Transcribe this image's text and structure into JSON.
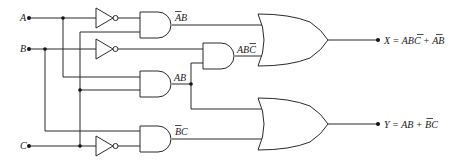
{
  "diagram": {
    "inputs": [
      {
        "name": "A",
        "label": "A"
      },
      {
        "name": "B",
        "label": "B"
      },
      {
        "name": "C",
        "label": "C"
      }
    ],
    "gates": [
      {
        "id": "not-a",
        "type": "NOT",
        "input": "A"
      },
      {
        "id": "not-b",
        "type": "NOT",
        "input": "B"
      },
      {
        "id": "not-c",
        "type": "NOT",
        "input": "C"
      },
      {
        "id": "and-abar-b",
        "type": "AND",
        "output_label": "ĀB"
      },
      {
        "id": "and-abcbar",
        "type": "AND",
        "output_label": "ABC̄"
      },
      {
        "id": "and-ab",
        "type": "AND",
        "output_label": "AB"
      },
      {
        "id": "and-bbar-c",
        "type": "AND",
        "output_label": "B̄C"
      },
      {
        "id": "or-x",
        "type": "OR"
      },
      {
        "id": "or-y",
        "type": "OR"
      }
    ],
    "labels": {
      "abar_b": {
        "bar": "A",
        "rest": "B"
      },
      "ab_cbar": {
        "pre": "AB",
        "bar": "C"
      },
      "ab": "AB",
      "bbar_c": {
        "bar": "B",
        "rest": "C"
      }
    },
    "outputs": {
      "x": {
        "lhs": "X = AB",
        "bar1": "C",
        "mid": " + ",
        "bar2": "A",
        "tail": "B",
        "text": "X = ABC̄ + ĀB"
      },
      "y": {
        "lhs": "Y = AB + ",
        "bar": "B",
        "tail": "C",
        "text": "Y = AB + B̄C"
      }
    },
    "colors": {
      "line": "#2a2a2a",
      "background": "#ffffff"
    }
  }
}
